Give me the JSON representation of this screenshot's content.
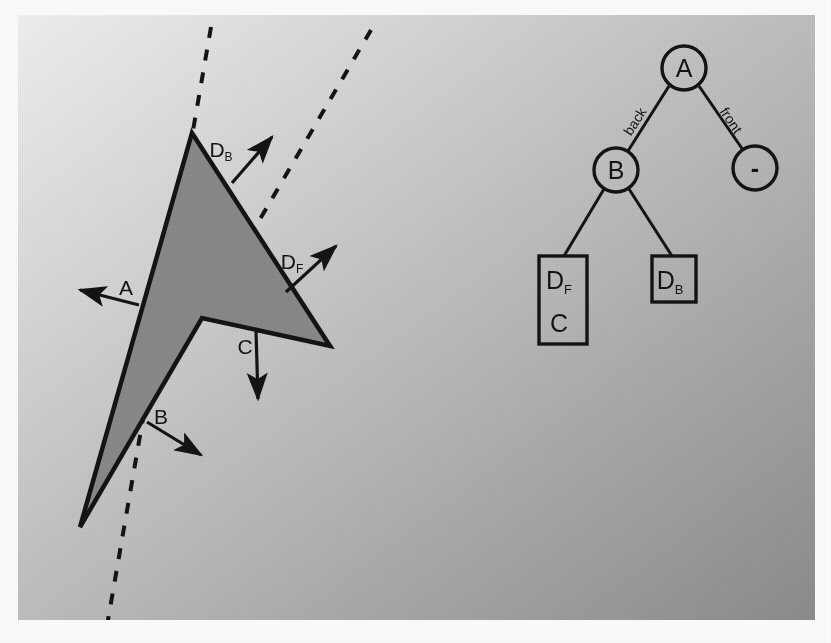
{
  "figure": {
    "canvas": {
      "background_gradient_from": "#f2f2f2",
      "background_gradient_to": "#8d8d8d",
      "page_background": "#ffffff",
      "x": 18,
      "y": 15,
      "width": 797,
      "height": 605
    },
    "ink_color": "#1a1a1a"
  },
  "left_diagram": {
    "name": "polygon-with-normals",
    "polygon": {
      "fill": "#8a8a8a",
      "stroke": "#141414",
      "points": "192,133 330,346 202,318 80,527"
    },
    "split_lines": [
      {
        "name": "split-line-1",
        "x1": 211,
        "y1": 27,
        "x2": 104,
        "y2": 643
      },
      {
        "name": "split-line-2",
        "x1": 371,
        "y1": 30,
        "x2": 202,
        "y2": 318
      }
    ],
    "normals": [
      {
        "label": "A",
        "sub": "",
        "label_x": 126,
        "label_y": 295,
        "x1": 139,
        "y1": 305,
        "x2": 80,
        "y2": 290
      },
      {
        "label": "B",
        "sub": "",
        "label_x": 161,
        "label_y": 424,
        "x1": 147,
        "y1": 422,
        "x2": 201,
        "y2": 455
      },
      {
        "label": "C",
        "sub": "",
        "label_x": 245,
        "label_y": 354,
        "x1": 256,
        "y1": 331,
        "x2": 258,
        "y2": 399
      },
      {
        "label": "D",
        "sub": "B",
        "label_x": 221,
        "label_y": 157,
        "x1": 232,
        "y1": 183,
        "x2": 272,
        "y2": 137
      },
      {
        "label": "D",
        "sub": "F",
        "label_x": 292,
        "label_y": 269,
        "x1": 286,
        "y1": 292,
        "x2": 336,
        "y2": 246
      }
    ]
  },
  "right_diagram": {
    "name": "bsp-tree",
    "nodes": [
      {
        "id": "A",
        "type": "circle",
        "label": "A",
        "cx": 684,
        "cy": 68,
        "r": 22
      },
      {
        "id": "neg",
        "type": "circle",
        "label": "-",
        "cx": 755,
        "cy": 168,
        "r": 22
      },
      {
        "id": "B",
        "type": "circle",
        "label": "B",
        "cx": 616,
        "cy": 170,
        "r": 22
      },
      {
        "id": "DFC",
        "type": "box",
        "label_top": "D",
        "label_top_sub": "F",
        "label_bottom": "C",
        "x": 539,
        "y": 256,
        "width": 48,
        "height": 88
      },
      {
        "id": "DB",
        "type": "box",
        "label_top": "D",
        "label_top_sub": "B",
        "label_bottom": "",
        "x": 652,
        "y": 256,
        "width": 44,
        "height": 46
      }
    ],
    "edges": [
      {
        "from": "A",
        "to": "B",
        "label": "back",
        "x1": 669,
        "y1": 86,
        "x2": 628,
        "y2": 151
      },
      {
        "from": "A",
        "to": "neg",
        "label": "front",
        "x1": 699,
        "y1": 86,
        "x2": 743,
        "y2": 150
      },
      {
        "from": "B",
        "to": "DFC",
        "label": "",
        "x1": 604,
        "y1": 189,
        "x2": 564,
        "y2": 256
      },
      {
        "from": "B",
        "to": "DB",
        "label": "",
        "x1": 629,
        "y1": 189,
        "x2": 672,
        "y2": 256
      }
    ],
    "edge_labels": [
      {
        "text": "back",
        "x": 639,
        "y": 124,
        "rotate": -57
      },
      {
        "text": "front",
        "x": 727,
        "y": 123,
        "rotate": 56
      }
    ]
  }
}
